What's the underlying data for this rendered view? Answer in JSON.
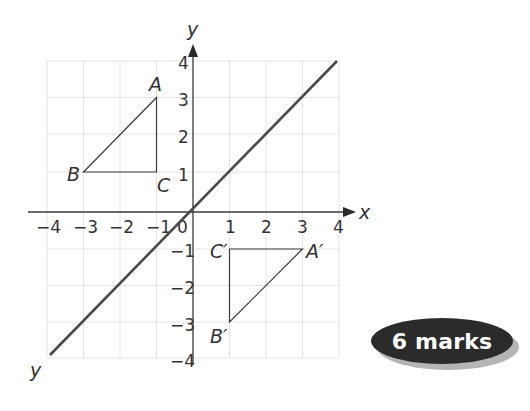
{
  "diagram": {
    "x_axis_label": "x",
    "y_axis_label": "y",
    "origin_label": "0",
    "x_ticks": [
      "−4",
      "−3",
      "−2",
      "−1",
      "1",
      "2",
      "3",
      "4"
    ],
    "y_ticks": [
      "4",
      "3",
      "2",
      "1",
      "−1",
      "−2",
      "−3",
      "−4"
    ],
    "mirror_line_label": "y",
    "triangle_original": {
      "A": {
        "label": "A",
        "x": -1,
        "y": 3
      },
      "B": {
        "label": "B",
        "x": -3,
        "y": 1
      },
      "C": {
        "label": "C",
        "x": -1,
        "y": 1
      }
    },
    "triangle_image": {
      "A": {
        "label": "A′",
        "x": 3,
        "y": -1
      },
      "B": {
        "label": "B′",
        "x": 1,
        "y": -3
      },
      "C": {
        "label": "C′",
        "x": 1,
        "y": -1
      }
    },
    "grid_range": {
      "x": [
        -4,
        4
      ],
      "y": [
        -4,
        4
      ]
    },
    "mirror_line": "y = x"
  },
  "badge": {
    "text": "6 marks",
    "color": "#2b2b2b"
  }
}
